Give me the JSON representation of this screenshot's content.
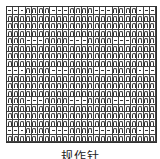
{
  "chart": {
    "title": "规作针",
    "columns": 24,
    "rows": 18,
    "legend": {
      "n": "knit stitch (∩ symbol)",
      "-": "purl stitch (— symbol)"
    },
    "pattern_rows": [
      "---nnnn---nnnn---nnnn---",
      "nnnnnnnnnnnnnnnnnnnnnnnn",
      "nnnnnnnnnnnnnnnnnnnnnnnn",
      "nnnnnnnnnnnnnnnnnnnnnnnn",
      "nnn---nnnn---nnnn---nnnn",
      "nnnnnnnnnnnnnnnnnnnnnnnn",
      "nnnnnnnnnnnnnnnnnnnnnnnn",
      "nnnnnnnnnnnnnnnnnnnnnnnn",
      "---nnnn---nnnn---nnnn---",
      "nnnnnnnnnnnnnnnnnnnnnnnn",
      "nnnnnnnnnnnnnnnnnnnnnnnn",
      "nnnnnnnnnnnnnnnnnnnnnnnn",
      "nnn---nnnn---nnnn---nnnn",
      "nnnnnnnnnnnnnnnnnnnnnnnn",
      "nnnnnnnnnnnnnnnnnnnnnnnn",
      "nnnnnnnnnnnnnnnnnnnnnnnn",
      "---nnnn---nnnn---nnnn---",
      "nnnnnnnnnnnnnnnnnnnnnnnn"
    ]
  }
}
